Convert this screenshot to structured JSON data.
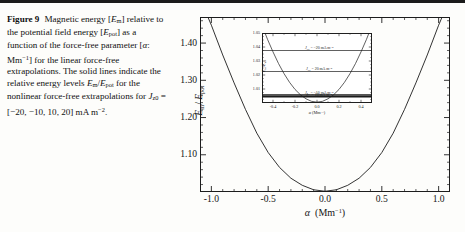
{
  "caption": {
    "figure_number": "Figure 9",
    "line1": "Magnetic energy [",
    "sym_em": "E",
    "sub_m": "m",
    "line2": "] relative to the potential field energy [",
    "sym_epot": "E",
    "sub_pot": "pot",
    "line3": "] as a function of the force-free parameter [",
    "alpha": "α",
    "unit_mm": ": Mm",
    "exp_m1": "−1",
    "line4": "] for the linear force-free extrapolations. The solid lines indicate the relative energy levels ",
    "ratio_num": "E",
    "ratio_den": "E",
    "line5": " for the nonlinear force-free extrapolations for ",
    "jz": "J",
    "jz_sub": "z0",
    "jz_values": " = [−20, −10, 10, 20] mA m",
    "jz_exp": "−2",
    "period": "."
  },
  "chart_data": {
    "type": "line",
    "title": "",
    "xlabel": "α  (Mm⁻¹)",
    "ylabel": "E_m / E_pot",
    "xlim": [
      -1.1,
      1.1
    ],
    "ylim": [
      1.0,
      1.47
    ],
    "xticks": [
      "-1.0",
      "-0.5",
      "0.0",
      "0.5",
      "1.0"
    ],
    "xtick_values": [
      -1.0,
      -0.5,
      0.0,
      0.5,
      1.0
    ],
    "yticks": [
      "1.10",
      "1.20",
      "1.30",
      "1.40"
    ],
    "ytick_values": [
      1.1,
      1.2,
      1.3,
      1.4
    ],
    "grid": false,
    "legend": "none",
    "series": [
      {
        "name": "linear force-free E_m/E_pot",
        "x": [
          -1.1,
          -1.0,
          -0.9,
          -0.8,
          -0.7,
          -0.6,
          -0.5,
          -0.4,
          -0.3,
          -0.2,
          -0.1,
          0.0,
          0.1,
          0.2,
          0.3,
          0.4,
          0.5,
          0.6,
          0.7,
          0.8,
          0.9,
          1.0,
          1.1
        ],
        "y": [
          1.52,
          1.448,
          1.368,
          1.293,
          1.222,
          1.158,
          1.106,
          1.066,
          1.037,
          1.018,
          1.006,
          1.002,
          1.006,
          1.018,
          1.037,
          1.066,
          1.106,
          1.158,
          1.222,
          1.293,
          1.368,
          1.448,
          1.52
        ]
      }
    ]
  },
  "inset": {
    "xlabel": "α  (Mm⁻¹)",
    "ylabel": "E_m/E_pot",
    "xlim": [
      -0.5,
      0.5
    ],
    "ylim": [
      1.0,
      1.05
    ],
    "xticks": [
      "-0.4",
      "-0.2",
      "0.0",
      "0.2",
      "0.4"
    ],
    "xtick_values": [
      -0.4,
      -0.2,
      0.0,
      0.2,
      0.4
    ],
    "yticks": [
      "1.01",
      "1.02",
      "1.03",
      "1.04",
      "1.05"
    ],
    "ytick_values": [
      1.01,
      1.02,
      1.03,
      1.04,
      1.05
    ],
    "curve": {
      "name": "linear force-free E_m/E_pot",
      "x": [
        -0.5,
        -0.45,
        -0.4,
        -0.35,
        -0.3,
        -0.25,
        -0.2,
        -0.15,
        -0.1,
        -0.05,
        0.0,
        0.05,
        0.1,
        0.15,
        0.2,
        0.25,
        0.3,
        0.35,
        0.4,
        0.45,
        0.5
      ],
      "y": [
        1.0555,
        1.0455,
        1.0365,
        1.0282,
        1.021,
        1.0148,
        1.0097,
        1.0058,
        1.003,
        1.0012,
        1.0006,
        1.0012,
        1.003,
        1.0058,
        1.0097,
        1.0148,
        1.021,
        1.0282,
        1.0365,
        1.0455,
        1.0555
      ]
    },
    "levels": [
      {
        "label_prefix": "J",
        "label_sub": "z0",
        "label_value": " = −20 mA m",
        "label_exp": "−2",
        "value": 1.0375,
        "thick": false,
        "label_x": 0.02
      },
      {
        "label_prefix": "J",
        "label_sub": "z0",
        "label_value": " = 20 mA m",
        "label_exp": "−2",
        "value": 1.0225,
        "thick": false,
        "label_x": 0.02
      },
      {
        "label_prefix": "J",
        "label_sub": "z0",
        "label_value": " = −10 mA m",
        "label_exp": "−2",
        "value": 1.0057,
        "thick": true,
        "label_x": 0.02
      },
      {
        "label_prefix": "J",
        "label_sub": "z0",
        "label_value": " = 10 mA m",
        "label_exp": "−2",
        "value": 1.0045,
        "thick": true,
        "label_x": 0.02
      }
    ]
  }
}
